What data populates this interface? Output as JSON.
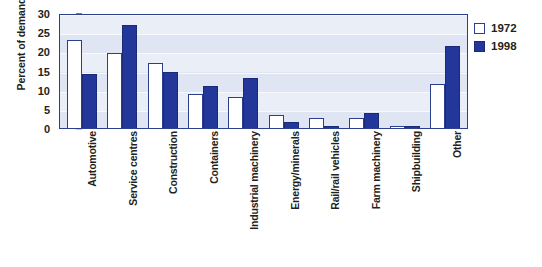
{
  "chart_data": {
    "type": "bar",
    "title": "",
    "xlabel": "",
    "ylabel": "Percent of demand",
    "ylim": [
      0,
      30
    ],
    "yticks": [
      0,
      5,
      10,
      15,
      20,
      25,
      30
    ],
    "ytick_labels": [
      "0",
      "5",
      "10",
      "15",
      "20",
      "25",
      "30"
    ],
    "grid": true,
    "legend_position": "right",
    "categories": [
      "Automotive",
      "Service centres",
      "Construction",
      "Containers",
      "Industrial machinery",
      "Energy/minerals",
      "Rail/rail vehicles",
      "Farm machinery",
      "Shipbuilding",
      "Other"
    ],
    "series": [
      {
        "name": "1972",
        "color": "#ffffff",
        "edge_color": "#2c3f8c",
        "values": [
          23,
          19.5,
          17,
          9,
          8,
          3.5,
          2.5,
          2.5,
          0.5,
          11.5
        ]
      },
      {
        "name": "1998",
        "color": "#23379a",
        "edge_color": "#1b2a78",
        "values": [
          14,
          27,
          14.5,
          11,
          13,
          1.5,
          0.5,
          4,
          0.5,
          21.5
        ]
      }
    ]
  },
  "legend": {
    "items": [
      {
        "label": "1972",
        "swatch": "open-square-swatch"
      },
      {
        "label": "1998",
        "swatch": "filled-square-swatch"
      }
    ]
  },
  "axes": {
    "y_title": "Percent of demand"
  },
  "colors": {
    "plot_background": "#dfe5f2",
    "plot_band": "#eaeef7",
    "plot_border": "#2c3f8c",
    "series_1972": "#ffffff",
    "series_1998": "#23379a",
    "text": "#231f20"
  }
}
